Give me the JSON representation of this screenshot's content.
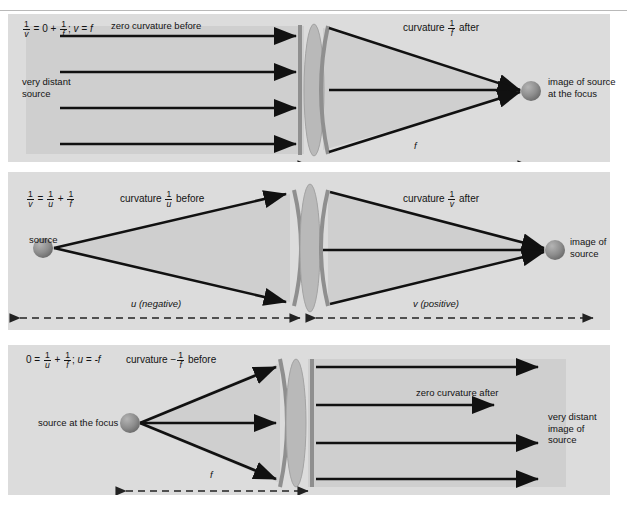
{
  "figure": {
    "top_cut_text": "",
    "background": "#ffffff",
    "panel_bg": "#dcdcdc",
    "ray_color": "#111111",
    "wavefront_color": "#8a8a8a",
    "lens_color": "#b6b6b6",
    "sphere_color": "#8d8d8d"
  },
  "panels": [
    {
      "id": "panel-1",
      "equation": {
        "lhs_num": "1",
        "lhs_den": "v",
        "eq": "=",
        "zero": "0",
        "plus": "+",
        "rhs_num": "1",
        "rhs_den": "f",
        "semicolon": ";",
        "tail": "v = f"
      },
      "before_label": "zero curvature before",
      "after_label_pre": "curvature",
      "after_frac_num": "1",
      "after_frac_den": "f",
      "after_label_post": "after",
      "source_label": "very distant\nsource",
      "source_label_line1": "very distant",
      "source_label_line2": "source",
      "image_label_line1": "image of source",
      "image_label_line2": "at the focus",
      "dimension_label": "f",
      "ray_count": 4
    },
    {
      "id": "panel-2",
      "equation": {
        "lhs_num": "1",
        "lhs_den": "v",
        "eq": "=",
        "mid_num": "1",
        "mid_den": "u",
        "plus": "+",
        "rhs_num": "1",
        "rhs_den": "f"
      },
      "before_label_pre": "curvature",
      "before_frac_num": "1",
      "before_frac_den": "u",
      "before_label_post": "before",
      "after_label_pre": "curvature",
      "after_frac_num": "1",
      "after_frac_den": "v",
      "after_label_post": "after",
      "source_label": "source",
      "image_label_line1": "image of",
      "image_label_line2": "source",
      "dimension_left_label": "u (negative)",
      "dimension_right_label": "v (positive)",
      "ray_count": 3
    },
    {
      "id": "panel-3",
      "equation": {
        "zero": "0",
        "eq": "=",
        "lhs_num": "1",
        "lhs_den": "u",
        "plus": "+",
        "rhs_num": "1",
        "rhs_den": "f",
        "semicolon": ";",
        "tail": "u = -f"
      },
      "before_label_pre": "curvature",
      "before_frac_sign": "−",
      "before_frac_num": "1",
      "before_frac_den": "f",
      "before_label_post": "before",
      "after_label": "zero curvature after",
      "source_label": "source at the focus",
      "image_label_line1": "very distant",
      "image_label_line2": "image of",
      "image_label_line3": "source",
      "dimension_label": "f",
      "ray_count": 4
    }
  ]
}
